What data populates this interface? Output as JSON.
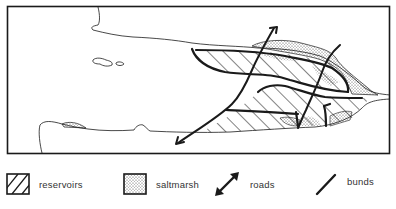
{
  "map": {
    "type": "schematic estuary map",
    "features": [
      "coastline",
      "islands",
      "reservoirs",
      "saltmarsh",
      "roads",
      "bunds"
    ],
    "colors": {
      "ink": "#1a1a1a",
      "background": "#ffffff",
      "stipple": "#555555"
    }
  },
  "legend": {
    "items": [
      {
        "key": "reservoirs",
        "label": "reservoirs",
        "symbol": "hatched-square"
      },
      {
        "key": "saltmarsh",
        "label": "saltmarsh",
        "symbol": "stippled-square"
      },
      {
        "key": "roads",
        "label": "roads",
        "symbol": "double-arrow"
      },
      {
        "key": "bunds",
        "label": "bunds",
        "symbol": "thick-line"
      }
    ]
  }
}
